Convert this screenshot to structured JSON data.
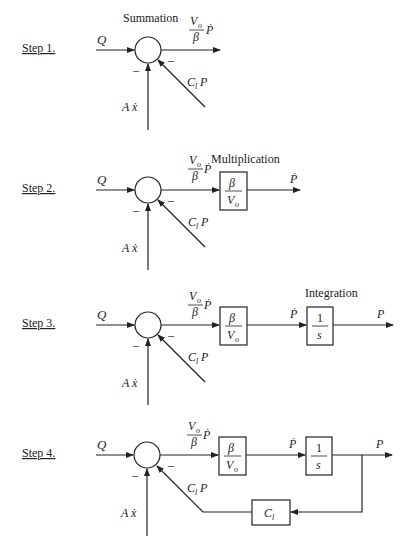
{
  "steps": [
    {
      "label": "Step 1.",
      "annotation": "Summation",
      "input": "Q",
      "output_num": "V",
      "output_num_sub": "o",
      "output_den": "β",
      "output_var": "Ṗ",
      "feedback": "C",
      "feedback_sub": "l",
      "feedback_var": "P",
      "disturbance": "A ẋ",
      "minus": "–"
    },
    {
      "label": "Step 2.",
      "annotation": "Multiplication",
      "input": "Q",
      "sum_num": "V",
      "sum_num_sub": "o",
      "sum_den": "β",
      "sum_var": "Ṗ",
      "block_num": "β",
      "block_den": "V",
      "block_den_sub": "o",
      "output": "Ṗ",
      "feedback": "C",
      "feedback_sub": "l",
      "feedback_var": "P",
      "disturbance": "A ẋ",
      "minus": "–"
    },
    {
      "label": "Step 3.",
      "annotation": "Integration",
      "input": "Q",
      "sum_num": "V",
      "sum_num_sub": "o",
      "sum_den": "β",
      "sum_var": "Ṗ",
      "block_num": "β",
      "block_den": "V",
      "block_den_sub": "o",
      "mid": "Ṗ",
      "int_num": "1",
      "int_den": "s",
      "output": "P",
      "feedback": "C",
      "feedback_sub": "l",
      "feedback_var": "P",
      "disturbance": "A ẋ",
      "minus": "–"
    },
    {
      "label": "Step 4.",
      "input": "Q",
      "sum_num": "V",
      "sum_num_sub": "o",
      "sum_den": "β",
      "sum_var": "Ṗ",
      "block_num": "β",
      "block_den": "V",
      "block_den_sub": "o",
      "mid": "Ṗ",
      "int_num": "1",
      "int_den": "s",
      "output": "P",
      "feedback": "C",
      "feedback_sub": "l",
      "feedback_var": "P",
      "fb_block": "C",
      "fb_block_sub": "l",
      "disturbance": "A ẋ",
      "minus": "–"
    }
  ]
}
